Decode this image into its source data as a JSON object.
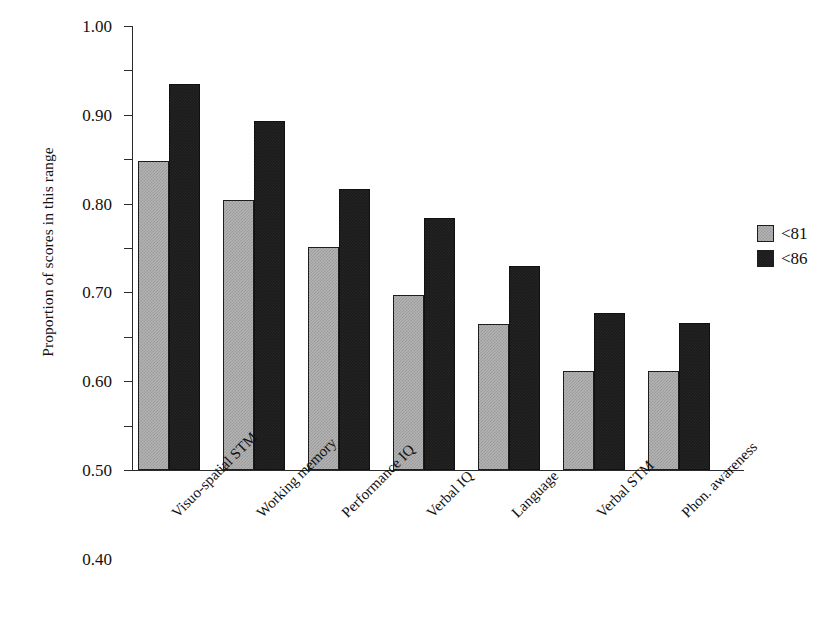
{
  "chart_data": {
    "type": "bar",
    "title": "",
    "subtitle": "",
    "xlabel": "",
    "ylabel": "Proportion of scores in this range",
    "ylim": [
      0.0,
      1.0
    ],
    "ytick_labels": [
      "1.00",
      "0.90",
      "0.80",
      "0.70",
      "0.60",
      "0.50",
      "0.40",
      "0.30",
      "0.20",
      "0.10",
      "0.00"
    ],
    "ytick_values": [
      1.0,
      0.9,
      0.8,
      0.7,
      0.6,
      0.5,
      0.4,
      0.3,
      0.2,
      0.1,
      0.0
    ],
    "grid": false,
    "legend_position": "right",
    "categories": [
      "Visuo-spatial STM",
      "Working memory",
      "Performance IQ",
      "Verbal IQ",
      "Language",
      "Verbal STM",
      "Phon. awareness"
    ],
    "series": [
      {
        "name": "<81",
        "color": "#b3b3b3",
        "values": [
          0.695,
          0.608,
          0.502,
          0.395,
          0.328,
          0.222,
          0.223
        ]
      },
      {
        "name": "<86",
        "color": "#1a1a1a",
        "values": [
          0.87,
          0.785,
          0.633,
          0.568,
          0.46,
          0.353,
          0.331
        ]
      }
    ],
    "annotations": []
  },
  "legend": {
    "entries": [
      {
        "label": "<81"
      },
      {
        "label": "<86"
      }
    ]
  }
}
